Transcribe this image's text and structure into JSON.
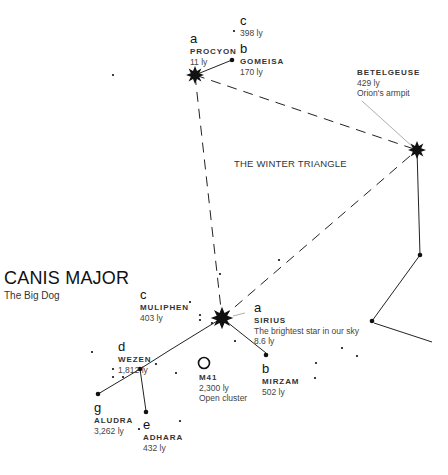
{
  "constellation": {
    "name": "CANIS MAJOR",
    "subtitle": "The Big Dog"
  },
  "asterism_label": "THE WINTER TRIANGLE",
  "colors": {
    "background": "#ffffff",
    "ink": "#111111",
    "text": "#333333",
    "pointer": "#999999"
  },
  "stars": [
    {
      "id": "procyon",
      "letter": "a",
      "name": "PROCYON",
      "distance": "11 ly",
      "note": ""
    },
    {
      "id": "gomeisa",
      "letter": "b",
      "name": "GOMEISA",
      "distance": "170 ly",
      "note": ""
    },
    {
      "id": "procyon-c",
      "letter": "c",
      "name": "",
      "distance": "398 ly",
      "note": ""
    },
    {
      "id": "betelgeuse",
      "letter": "",
      "name": "BETELGEUSE",
      "distance": "429 ly",
      "note": "Orion's armpit"
    },
    {
      "id": "sirius",
      "letter": "a",
      "name": "SIRIUS",
      "distance": "8.6 ly",
      "note": "The brightest star in our sky"
    },
    {
      "id": "mirzam",
      "letter": "b",
      "name": "MIRZAM",
      "distance": "502 ly",
      "note": ""
    },
    {
      "id": "muliphen",
      "letter": "c",
      "name": "MULIPHEN",
      "distance": "403 ly",
      "note": ""
    },
    {
      "id": "wezen",
      "letter": "d",
      "name": "WEZEN",
      "distance": "1,812 ly",
      "note": ""
    },
    {
      "id": "adhara",
      "letter": "e",
      "name": "ADHARA",
      "distance": "432 ly",
      "note": ""
    },
    {
      "id": "aludra",
      "letter": "g",
      "name": "ALUDRA",
      "distance": "3,262 ly",
      "note": ""
    }
  ],
  "clusters": [
    {
      "id": "m41",
      "name": "M41",
      "distance": "2,300 ly",
      "note": "Open cluster"
    }
  ]
}
